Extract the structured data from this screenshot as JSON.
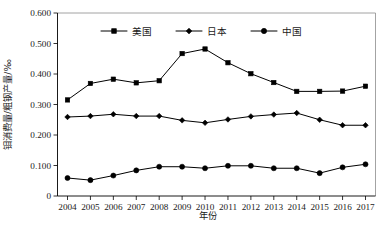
{
  "chart_data": {
    "type": "line",
    "title": "",
    "xlabel": "年份",
    "ylabel": "钼消费量/粗钢产量/‰",
    "x": [
      2004,
      2005,
      2006,
      2007,
      2008,
      2009,
      2010,
      2011,
      2012,
      2013,
      2014,
      2015,
      2016,
      2017
    ],
    "categories": [
      "2004",
      "2005",
      "2006",
      "2007",
      "2008",
      "2009",
      "2010",
      "2011",
      "2012",
      "2013",
      "2014",
      "2015",
      "2016",
      "2017"
    ],
    "ylim": [
      0,
      0.6
    ],
    "yticks": [
      0,
      0.1,
      0.2,
      0.3,
      0.4,
      0.5,
      0.6
    ],
    "ytick_labels": [
      "0",
      "0.100",
      "0.200",
      "0.300",
      "0.400",
      "0.500",
      "0.600"
    ],
    "grid": false,
    "legend_position": "top-center",
    "series": [
      {
        "name": "美国",
        "marker": "square",
        "color": "#000000",
        "values": [
          0.315,
          0.369,
          0.383,
          0.371,
          0.378,
          0.467,
          0.482,
          0.437,
          0.401,
          0.372,
          0.343,
          0.343,
          0.344,
          0.36
        ]
      },
      {
        "name": "日本",
        "marker": "diamond",
        "color": "#000000",
        "values": [
          0.259,
          0.262,
          0.268,
          0.262,
          0.262,
          0.248,
          0.24,
          0.251,
          0.261,
          0.267,
          0.272,
          0.25,
          0.232,
          0.232
        ]
      },
      {
        "name": "中国",
        "marker": "circle",
        "color": "#000000",
        "values": [
          0.059,
          0.052,
          0.067,
          0.084,
          0.096,
          0.096,
          0.091,
          0.099,
          0.099,
          0.091,
          0.091,
          0.075,
          0.094,
          0.104
        ]
      }
    ]
  },
  "legend": {
    "items": [
      {
        "label": "美国",
        "marker": "square"
      },
      {
        "label": "日本",
        "marker": "diamond"
      },
      {
        "label": "中国",
        "marker": "circle"
      }
    ]
  },
  "axes": {
    "x_title": "年份",
    "y_title": "钼消费量/粗钢产量/‰"
  },
  "caption": {
    "text": ""
  }
}
